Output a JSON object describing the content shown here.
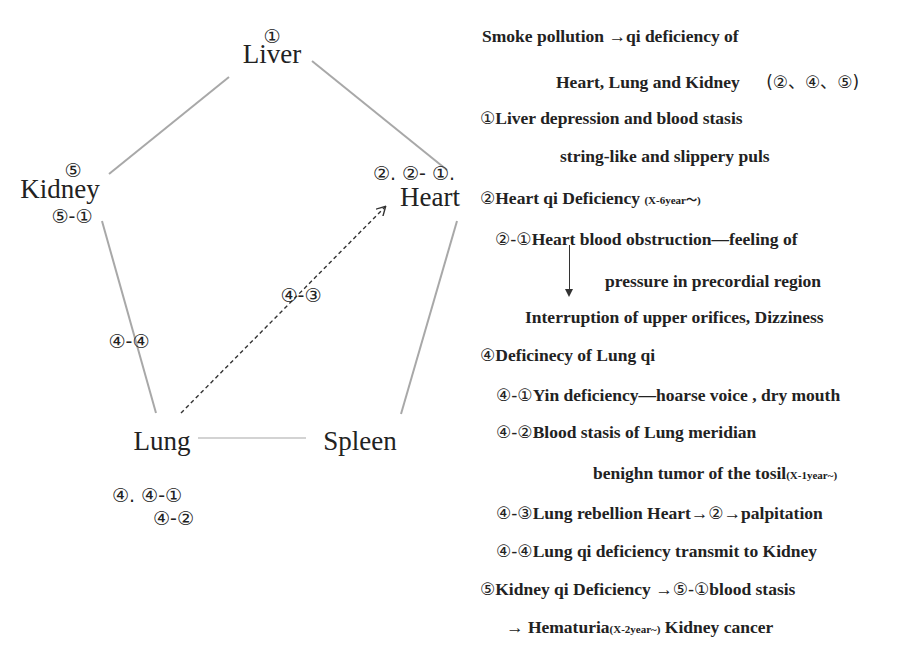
{
  "diagram": {
    "nodes": {
      "liver": {
        "badge": "①",
        "name": "Liver"
      },
      "kidney": {
        "badge_top": "⑤",
        "name": "Kidney",
        "badge_bottom": "⑤-①"
      },
      "heart": {
        "badge": "②. ②- ①.",
        "name": "Heart"
      },
      "lung": {
        "name": "Lung",
        "badge_line1": "④. ④-①",
        "badge_line2": "④-②"
      },
      "spleen": {
        "name": "Spleen"
      }
    },
    "edges": [
      {
        "from": "Liver",
        "to": "Kidney",
        "style": "solid"
      },
      {
        "from": "Liver",
        "to": "Heart",
        "style": "solid"
      },
      {
        "from": "Kidney",
        "to": "Lung",
        "style": "solid",
        "label": "④-④"
      },
      {
        "from": "Heart",
        "to": "Spleen",
        "style": "solid"
      },
      {
        "from": "Lung",
        "to": "Spleen",
        "style": "solid"
      },
      {
        "from": "Lung",
        "to": "Heart",
        "style": "dashed-arrow",
        "label": "④-③"
      }
    ],
    "edge_labels": {
      "lung_kidney": "④-④",
      "lung_heart": "④-③"
    }
  },
  "notes": {
    "l1": "Smoke pollution →qi deficiency of",
    "l2a": "Heart, Lung and  Kidney",
    "l2b": "(②、④、⑤)",
    "l3_circ": "①",
    "l3": "Liver depression and blood stasis",
    "l4": "string-like and slippery puls",
    "l5_circ": "②",
    "l5": "Heart qi Deficiency",
    "l5_small": "(X-6year～)",
    "l6_circ": "②-①",
    "l6": "Heart blood obstruction—feeling of",
    "l7": "pressure in precordial region",
    "l8": "Interruption of upper orifices, Dizziness",
    "l9_circ": "④",
    "l9": "Deficinecy of Lung qi",
    "l10_circ": "④-①",
    "l10": "Yin deficiency—hoarse voice , dry mouth",
    "l11_circ": "④-②",
    "l11": "Blood stasis of Lung meridian",
    "l12": "benighn tumor of the tosil",
    "l12_small": "(X-1year~)",
    "l13_circ": "④-③",
    "l13a": "Lung rebellion Heart→",
    "l13_circ2": "②",
    "l13b": "→palpitation",
    "l14_circ": "④-④",
    "l14": "Lung qi deficiency transmit to Kidney",
    "l15_circ": "⑤",
    "l15a": "Kidney qi Deficiency →",
    "l15_circ2": "⑤-①",
    "l15b": "blood stasis",
    "l16a": "→ Hematuria",
    "l16_small": "(X-2year~)",
    "l16b": " Kidney cancer"
  },
  "colors": {
    "text": "#222222",
    "edge": "#a8a8a8",
    "dashed_edge": "#333333",
    "background": "#ffffff"
  }
}
